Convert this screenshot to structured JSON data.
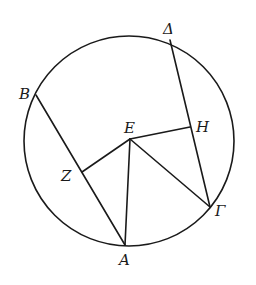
{
  "diagram": {
    "type": "geometric-figure",
    "colors": {
      "stroke": "#1a1a1a",
      "background": "#ffffff"
    },
    "circle": {
      "cx": 129,
      "cy": 141,
      "r": 105
    },
    "points": {
      "B": {
        "label": "B",
        "x": 36,
        "y": 95
      },
      "Delta": {
        "label": "Δ",
        "x": 170,
        "y": 40
      },
      "E": {
        "label": "E",
        "x": 130,
        "y": 139
      },
      "H": {
        "label": "H",
        "x": 190,
        "y": 127
      },
      "Z": {
        "label": "Z",
        "x": 82,
        "y": 172
      },
      "A": {
        "label": "A",
        "x": 125,
        "y": 245
      },
      "Gamma": {
        "label": "Γ",
        "x": 210,
        "y": 207
      }
    },
    "segments": [
      {
        "from": "B",
        "to": "A"
      },
      {
        "from": "Delta",
        "to": "Gamma"
      },
      {
        "from": "E",
        "to": "Z"
      },
      {
        "from": "E",
        "to": "H"
      },
      {
        "from": "E",
        "to": "A"
      },
      {
        "from": "E",
        "to": "Gamma"
      }
    ],
    "labels": {
      "B": "B",
      "Delta": "Δ",
      "E": "E",
      "H": "H",
      "Z": "Z",
      "A": "A",
      "Gamma": "Γ"
    }
  }
}
